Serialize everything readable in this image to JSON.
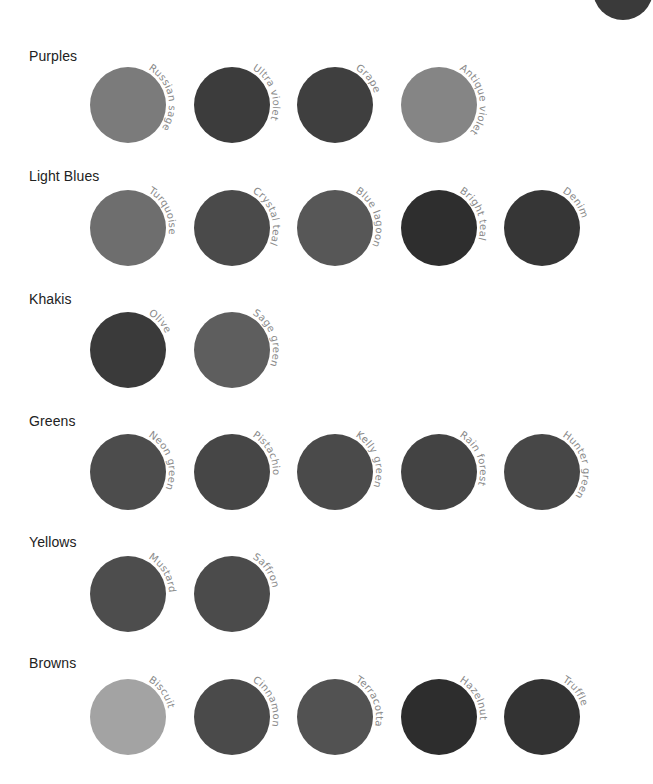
{
  "groups": [
    {
      "title": "Purples",
      "swatches": [
        {
          "name": "Russian sage",
          "color": "#7b7b7b"
        },
        {
          "name": "Ultra violet",
          "color": "#3c3c3c"
        },
        {
          "name": "Grape",
          "color": "#3f3f3f"
        },
        {
          "name": "Antique violet",
          "color": "#858585"
        }
      ]
    },
    {
      "title": "Light Blues",
      "swatches": [
        {
          "name": "Turquoise",
          "color": "#6e6e6e"
        },
        {
          "name": "Crystal teal",
          "color": "#4a4a4a"
        },
        {
          "name": "Blue lagoon",
          "color": "#575757"
        },
        {
          "name": "Bright teal",
          "color": "#2e2e2e"
        },
        {
          "name": "Denim",
          "color": "#363636"
        }
      ]
    },
    {
      "title": "Khakis",
      "swatches": [
        {
          "name": "Olive",
          "color": "#3a3a3a"
        },
        {
          "name": "Sage green",
          "color": "#5e5e5e"
        }
      ]
    },
    {
      "title": "Greens",
      "swatches": [
        {
          "name": "Neon green",
          "color": "#4c4c4c"
        },
        {
          "name": "Pistachio",
          "color": "#464646"
        },
        {
          "name": "Kelly green",
          "color": "#4a4a4a"
        },
        {
          "name": "Rain forest",
          "color": "#434343"
        },
        {
          "name": "Hunter green",
          "color": "#474747"
        }
      ]
    },
    {
      "title": "Yellows",
      "swatches": [
        {
          "name": "Mustard",
          "color": "#4d4d4d"
        },
        {
          "name": "Saffron",
          "color": "#4b4b4b"
        }
      ]
    },
    {
      "title": "Browns",
      "swatches": [
        {
          "name": "Biscuit",
          "color": "#a3a3a3"
        },
        {
          "name": "Cinnamon",
          "color": "#4a4a4a"
        },
        {
          "name": "Terracotta",
          "color": "#525252"
        },
        {
          "name": "Hazelnut",
          "color": "#2d2d2d"
        },
        {
          "name": "Truffle",
          "color": "#333333"
        }
      ]
    }
  ]
}
